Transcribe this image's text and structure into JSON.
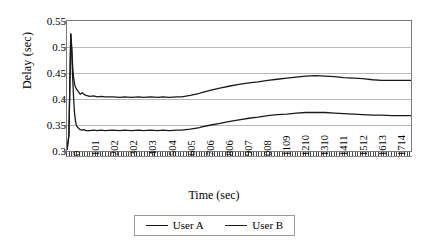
{
  "chart_data": {
    "type": "line",
    "title": "",
    "xlabel": "Time (sec)",
    "ylabel": "Delay (sec)",
    "xlim": [
      0,
      1815
    ],
    "ylim": [
      0.3,
      0.55
    ],
    "yticks": [
      "0.3",
      "0.35",
      "0.4",
      "0.45",
      "0.5",
      "0.55"
    ],
    "ytick_values": [
      0.3,
      0.35,
      0.4,
      0.45,
      0.5,
      0.55
    ],
    "xticks": [
      "0",
      "101",
      "202",
      "302",
      "403",
      "504",
      "605",
      "706",
      "806",
      "907",
      "008",
      "1109",
      "1210",
      "1310",
      "1411",
      "1512",
      "1613",
      "1714"
    ],
    "xtick_values": [
      0,
      101,
      202,
      302,
      403,
      504,
      605,
      706,
      806,
      907,
      1008,
      1109,
      1210,
      1310,
      1411,
      1512,
      1613,
      1714
    ],
    "grid": "horizontal",
    "legend_position": "bottom",
    "series": [
      {
        "name": "User A",
        "color": "#1a1a1a",
        "x": [
          0,
          10,
          20,
          25,
          30,
          35,
          40,
          45,
          50,
          60,
          70,
          80,
          90,
          101,
          120,
          140,
          160,
          180,
          202,
          240,
          280,
          302,
          340,
          380,
          403,
          440,
          480,
          504,
          540,
          580,
          605,
          650,
          700,
          706,
          760,
          806,
          860,
          907,
          960,
          1008,
          1060,
          1109,
          1160,
          1210,
          1260,
          1310,
          1360,
          1411,
          1460,
          1512,
          1560,
          1613,
          1660,
          1714,
          1760,
          1815
        ],
        "y": [
          0.302,
          0.33,
          0.525,
          0.5,
          0.462,
          0.44,
          0.428,
          0.423,
          0.419,
          0.414,
          0.409,
          0.412,
          0.409,
          0.407,
          0.405,
          0.406,
          0.404,
          0.405,
          0.404,
          0.404,
          0.403,
          0.404,
          0.403,
          0.404,
          0.403,
          0.404,
          0.403,
          0.404,
          0.403,
          0.404,
          0.404,
          0.407,
          0.411,
          0.412,
          0.417,
          0.421,
          0.425,
          0.428,
          0.431,
          0.433,
          0.436,
          0.438,
          0.44,
          0.442,
          0.444,
          0.445,
          0.444,
          0.443,
          0.441,
          0.44,
          0.439,
          0.437,
          0.436,
          0.436,
          0.436,
          0.436
        ]
      },
      {
        "name": "User B",
        "color": "#1a1a1a",
        "x": [
          0,
          10,
          20,
          25,
          30,
          35,
          40,
          45,
          50,
          60,
          70,
          80,
          90,
          101,
          120,
          140,
          160,
          180,
          202,
          240,
          280,
          302,
          340,
          380,
          403,
          440,
          480,
          504,
          540,
          580,
          605,
          650,
          700,
          706,
          760,
          806,
          860,
          907,
          960,
          1008,
          1060,
          1109,
          1160,
          1210,
          1260,
          1310,
          1360,
          1411,
          1460,
          1512,
          1560,
          1613,
          1660,
          1714,
          1760,
          1815
        ],
        "y": [
          0.302,
          0.33,
          0.525,
          0.49,
          0.44,
          0.4,
          0.372,
          0.357,
          0.349,
          0.344,
          0.341,
          0.34,
          0.341,
          0.339,
          0.339,
          0.34,
          0.339,
          0.34,
          0.339,
          0.34,
          0.339,
          0.34,
          0.339,
          0.34,
          0.339,
          0.34,
          0.339,
          0.34,
          0.339,
          0.34,
          0.34,
          0.342,
          0.345,
          0.346,
          0.35,
          0.353,
          0.357,
          0.36,
          0.363,
          0.365,
          0.368,
          0.37,
          0.371,
          0.373,
          0.374,
          0.374,
          0.374,
          0.373,
          0.372,
          0.371,
          0.37,
          0.369,
          0.369,
          0.368,
          0.368,
          0.368
        ]
      }
    ]
  },
  "legend": {
    "entries": [
      {
        "label": "User A"
      },
      {
        "label": "User B"
      }
    ]
  }
}
